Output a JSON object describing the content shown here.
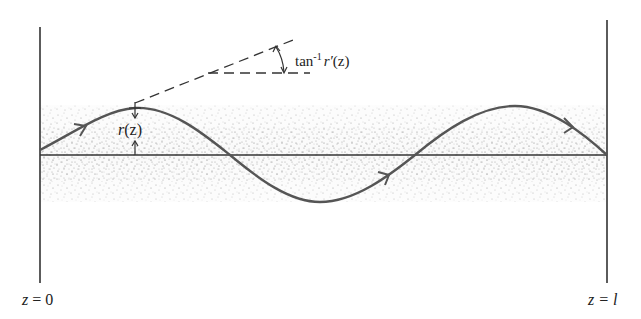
{
  "diagram": {
    "labels": {
      "angle_label_prefix": "tan",
      "angle_label_sup": "-1",
      "angle_label_func": "r′",
      "angle_label_arg": "(z)",
      "radius_label_func": "r",
      "radius_label_arg": "(z)",
      "left_boundary_var": "z",
      "left_boundary_eq": " = 0",
      "right_boundary_var": "z",
      "right_boundary_eq": " = l"
    },
    "colors": {
      "line": "#333333",
      "ray": "#555555",
      "shading_dots": "#6a6a6a"
    }
  }
}
